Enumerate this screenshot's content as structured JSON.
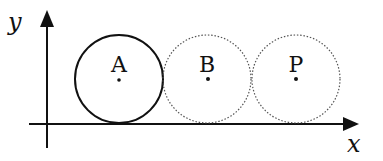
{
  "axes": {
    "x_label": "x",
    "y_label": "y"
  },
  "circles": [
    {
      "label": "A",
      "style": "solid",
      "cx": 119,
      "cy": 79,
      "r": 44
    },
    {
      "label": "B",
      "style": "dotted",
      "cx": 207,
      "cy": 79,
      "r": 44
    },
    {
      "label": "P",
      "style": "dotted",
      "cx": 296,
      "cy": 79,
      "r": 44
    }
  ],
  "colors": {
    "stroke": "#111111",
    "dotted_stroke": "#555555",
    "background": "#ffffff"
  }
}
